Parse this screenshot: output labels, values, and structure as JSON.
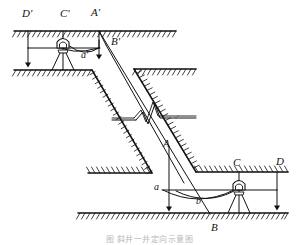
{
  "figure": {
    "caption": "图 斜井一井定向示意图",
    "width": 299,
    "height": 245,
    "background": "#ffffff",
    "line_color": "#111111",
    "hatch_color": "#222222"
  },
  "labels": {
    "surface": {
      "d_prime": "D'",
      "c_prime": "C'",
      "a_prime_upper": "A'",
      "b_prime": "B'",
      "a_prime_lower": "a'"
    },
    "underground": {
      "a_upper": "A",
      "a_lower": "a",
      "b_lower": "b",
      "b_upper": "B",
      "c": "C",
      "d": "D"
    }
  },
  "label_positions": [
    {
      "name": "label-D-prime",
      "text": "D'",
      "x": 22,
      "y": 10,
      "size": "cap"
    },
    {
      "name": "label-C-prime",
      "text": "C'",
      "x": 61,
      "y": 10,
      "size": "cap"
    },
    {
      "name": "label-A-prime",
      "text": "A'",
      "x": 92,
      "y": 9,
      "size": "cap"
    },
    {
      "name": "label-B-prime",
      "text": "B'",
      "x": 111,
      "y": 37,
      "size": "cap"
    },
    {
      "name": "label-a-prime",
      "text": "a'",
      "x": 81,
      "y": 51,
      "size": "low"
    },
    {
      "name": "label-A",
      "text": "A",
      "x": 163,
      "y": 139,
      "size": "cap"
    },
    {
      "name": "label-a",
      "text": "a",
      "x": 155,
      "y": 183,
      "size": "low"
    },
    {
      "name": "label-b",
      "text": "b",
      "x": 196,
      "y": 198,
      "size": "low"
    },
    {
      "name": "label-B",
      "text": "B",
      "x": 212,
      "y": 225,
      "size": "cap"
    },
    {
      "name": "label-C",
      "text": "C",
      "x": 234,
      "y": 159,
      "size": "cap"
    },
    {
      "name": "label-D",
      "text": "D",
      "x": 277,
      "y": 158,
      "size": "cap"
    }
  ],
  "geometry": {
    "surface_ground_line": {
      "x1": 14,
      "y1": 31,
      "x2": 176,
      "y2": 31
    },
    "surface_lower_ground_line": {
      "x1": 14,
      "y1": 70,
      "x2": 92,
      "y2": 70
    },
    "underground_upper_ground_line": {
      "x1": 134,
      "y1": 69,
      "x2": 196,
      "y2": 69
    },
    "underground_left_ground_line": {
      "x1": 88,
      "y1": 173,
      "x2": 152,
      "y2": 173
    },
    "underground_right_ground_line": {
      "x1": 196,
      "y1": 172,
      "x2": 288,
      "y2": 172
    },
    "underground_floor_line": {
      "x1": 78,
      "y1": 213,
      "x2": 288,
      "y2": 213
    },
    "shaft_left_wall": {
      "x1": 92,
      "y1": 70,
      "x2": 152,
      "y2": 173
    },
    "shaft_right_wall": {
      "x1": 134,
      "y1": 69,
      "x2": 196,
      "y2": 172
    },
    "plumb_wire_A": {
      "x1": 99,
      "y1": 31,
      "x2": 210,
      "y2": 213
    },
    "plumb_wire_B": {
      "x1": 106,
      "y1": 45,
      "x2": 183,
      "y2": 182
    },
    "surface_traverse_line": {
      "y": 48,
      "from_x": 28,
      "to_x": 100
    },
    "underground_traverse_line": {
      "y": 190,
      "from_x": 162,
      "to_x": 277
    },
    "arrow_D_prime": {
      "x": 28,
      "y_from": 31,
      "y_to": 66
    },
    "arrow_A_prime": {
      "x": 99,
      "y_from": 31,
      "y_to": 58
    },
    "arrow_A": {
      "x": 169,
      "y_from": 148,
      "y_to": 210
    },
    "arrow_D": {
      "x": 277,
      "y_from": 172,
      "y_to": 209
    },
    "tripod_surface": {
      "cx": 63,
      "cy": 45,
      "base_y": 70
    },
    "tripod_underground": {
      "cx": 239,
      "cy": 187,
      "base_y": 213
    },
    "break_symbol": {
      "cx": 148,
      "cy": 115
    }
  }
}
